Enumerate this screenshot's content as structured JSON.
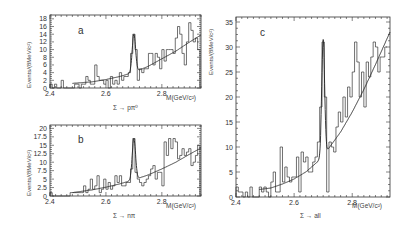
{
  "figure": {
    "xlabel": "M(GeV/c²)",
    "ylabel": "Events/(8MeV/c²)"
  },
  "chart_data": [
    {
      "type": "bar",
      "panel": "a",
      "subtitle": "Σ → pπ⁰",
      "xlabel": "M(GeV/c²)",
      "ylabel": "Events/(8MeV/c²)",
      "xlim": [
        2.4,
        2.94
      ],
      "ylim": [
        0,
        19
      ],
      "xticks": [
        2.4,
        2.6,
        2.8
      ],
      "yticks": [
        0,
        2,
        4,
        6,
        8,
        10,
        12,
        14,
        16,
        18
      ],
      "box": {
        "x0": 50,
        "x1": 201,
        "y0": 15,
        "y1": 88
      },
      "bin_width": 0.008,
      "x": [
        2.404,
        2.412,
        2.42,
        2.428,
        2.436,
        2.444,
        2.452,
        2.46,
        2.468,
        2.476,
        2.484,
        2.492,
        2.5,
        2.508,
        2.516,
        2.524,
        2.532,
        2.54,
        2.548,
        2.556,
        2.564,
        2.572,
        2.58,
        2.588,
        2.596,
        2.604,
        2.612,
        2.62,
        2.628,
        2.636,
        2.644,
        2.652,
        2.66,
        2.668,
        2.676,
        2.684,
        2.692,
        2.7,
        2.708,
        2.716,
        2.724,
        2.732,
        2.74,
        2.748,
        2.756,
        2.764,
        2.772,
        2.78,
        2.788,
        2.796,
        2.804,
        2.812,
        2.82,
        2.828,
        2.836,
        2.844,
        2.852,
        2.86,
        2.868,
        2.876,
        2.884,
        2.892,
        2.9,
        2.908,
        2.916,
        2.924,
        2.932
      ],
      "values": [
        1,
        0,
        1,
        0,
        0,
        2,
        0,
        0,
        0,
        0,
        0,
        1,
        1,
        0,
        1,
        1,
        3,
        2,
        1,
        1,
        6,
        3,
        2,
        2,
        1,
        2,
        0,
        3,
        1,
        2,
        1,
        4,
        2,
        3,
        3,
        4,
        9,
        14,
        10,
        2,
        5,
        4,
        5,
        5,
        9,
        9,
        6,
        9,
        8,
        5,
        10,
        7,
        10,
        10,
        10,
        9,
        13,
        16,
        14,
        9,
        6,
        12,
        17,
        15,
        12,
        13,
        10
      ],
      "fit": {
        "peak_center": 2.7,
        "peak_height": 14,
        "peak_sigma": 0.006
      },
      "bg_curve": [
        [
          2.48,
          1.2
        ],
        [
          2.55,
          1.6
        ],
        [
          2.6,
          2.2
        ],
        [
          2.65,
          3.0
        ],
        [
          2.7,
          4.1
        ],
        [
          2.75,
          5.6
        ],
        [
          2.8,
          7.6
        ],
        [
          2.85,
          9.6
        ],
        [
          2.9,
          12.0
        ],
        [
          2.94,
          13.8
        ]
      ]
    },
    {
      "type": "bar",
      "panel": "b",
      "subtitle": "Σ → nπ",
      "xlabel": "M(GeV/c²)",
      "ylabel": "Events/(8MeV/c²)",
      "xlim": [
        2.4,
        2.94
      ],
      "ylim": [
        0,
        21
      ],
      "xticks": [
        2.4,
        2.6,
        2.8
      ],
      "yticks": [
        0,
        2.5,
        5,
        7.5,
        10,
        12.5,
        15,
        17.5,
        20
      ],
      "box": {
        "x0": 50,
        "x1": 201,
        "y0": 125,
        "y1": 196
      },
      "bin_width": 0.008,
      "x": [
        2.404,
        2.412,
        2.42,
        2.428,
        2.436,
        2.444,
        2.452,
        2.46,
        2.468,
        2.476,
        2.484,
        2.492,
        2.5,
        2.508,
        2.516,
        2.524,
        2.532,
        2.54,
        2.548,
        2.556,
        2.564,
        2.572,
        2.58,
        2.588,
        2.596,
        2.604,
        2.612,
        2.62,
        2.628,
        2.636,
        2.644,
        2.652,
        2.66,
        2.668,
        2.676,
        2.684,
        2.692,
        2.7,
        2.708,
        2.716,
        2.724,
        2.732,
        2.74,
        2.748,
        2.756,
        2.764,
        2.772,
        2.78,
        2.788,
        2.796,
        2.804,
        2.812,
        2.82,
        2.828,
        2.836,
        2.844,
        2.852,
        2.86,
        2.868,
        2.876,
        2.884,
        2.892,
        2.9,
        2.908,
        2.916,
        2.924,
        2.932
      ],
      "values": [
        1,
        0,
        0,
        0,
        0,
        0,
        0,
        0,
        0,
        1,
        1,
        1,
        1,
        1,
        1,
        3,
        1,
        2,
        5,
        2,
        3,
        6,
        1,
        2,
        5,
        2,
        4,
        2,
        3,
        6,
        4,
        6,
        3,
        3,
        4,
        4,
        8,
        17,
        7,
        5,
        4,
        3,
        4,
        5,
        6,
        8,
        9,
        5,
        7,
        7,
        3,
        16,
        12,
        17,
        14,
        17,
        16,
        11,
        12,
        14,
        12,
        13,
        14,
        9,
        10,
        12,
        15
      ],
      "fit": {
        "peak_center": 2.7,
        "peak_height": 17,
        "peak_sigma": 0.006
      },
      "bg_curve": [
        [
          2.48,
          1.0
        ],
        [
          2.55,
          1.8
        ],
        [
          2.6,
          2.6
        ],
        [
          2.65,
          3.6
        ],
        [
          2.7,
          4.8
        ],
        [
          2.75,
          6.2
        ],
        [
          2.8,
          8.0
        ],
        [
          2.85,
          10.0
        ],
        [
          2.9,
          12.4
        ],
        [
          2.94,
          14.2
        ]
      ]
    },
    {
      "type": "bar",
      "panel": "c",
      "subtitle": "Σ → all",
      "xlabel": "M(GeV/c²)",
      "ylabel": "Events/(8MeV/c²)",
      "xlim": [
        2.4,
        2.93
      ],
      "ylim": [
        0,
        36
      ],
      "xticks": [
        2.4,
        2.6,
        2.8
      ],
      "yticks": [
        0,
        5,
        10,
        15,
        20,
        25,
        30,
        35
      ],
      "box": {
        "x0": 236,
        "x1": 390,
        "y0": 17,
        "y1": 197
      },
      "bin_width": 0.008,
      "x": [
        2.404,
        2.412,
        2.42,
        2.428,
        2.436,
        2.444,
        2.452,
        2.46,
        2.468,
        2.476,
        2.484,
        2.492,
        2.5,
        2.508,
        2.516,
        2.524,
        2.532,
        2.54,
        2.548,
        2.556,
        2.564,
        2.572,
        2.58,
        2.588,
        2.596,
        2.604,
        2.612,
        2.62,
        2.628,
        2.636,
        2.644,
        2.652,
        2.66,
        2.668,
        2.676,
        2.684,
        2.692,
        2.7,
        2.708,
        2.716,
        2.724,
        2.732,
        2.74,
        2.748,
        2.756,
        2.764,
        2.772,
        2.78,
        2.788,
        2.796,
        2.804,
        2.812,
        2.82,
        2.828,
        2.836,
        2.844,
        2.852,
        2.86,
        2.868,
        2.876,
        2.884,
        2.892,
        2.9,
        2.908,
        2.916,
        2.924
      ],
      "values": [
        2,
        1,
        1,
        0,
        1,
        0,
        2,
        0,
        0,
        0,
        2,
        1,
        2,
        1,
        0,
        3,
        5,
        1,
        1,
        10,
        3,
        6,
        4,
        3,
        4,
        4,
        8,
        1,
        9,
        7,
        8,
        5,
        5,
        7,
        8,
        11,
        18,
        31,
        20,
        1,
        11,
        10,
        9,
        14,
        17,
        15,
        20,
        16,
        22,
        20,
        25,
        31,
        27,
        20,
        25,
        18,
        27,
        24,
        28,
        31,
        30,
        25,
        28,
        28,
        30
      ],
      "fit": {
        "peak_center": 2.7,
        "peak_height": 31.5,
        "peak_sigma": 0.005
      },
      "bg_curve": [
        [
          2.48,
          1.5
        ],
        [
          2.52,
          1.8
        ],
        [
          2.56,
          2.6
        ],
        [
          2.6,
          3.6
        ],
        [
          2.64,
          5.0
        ],
        [
          2.68,
          7.0
        ],
        [
          2.7,
          8.2
        ],
        [
          2.72,
          9.8
        ],
        [
          2.76,
          13.0
        ],
        [
          2.8,
          17.0
        ],
        [
          2.84,
          21.5
        ],
        [
          2.88,
          26.5
        ],
        [
          2.93,
          33.0
        ]
      ]
    }
  ],
  "panels": {
    "a": {
      "letter": "a",
      "decay": "Σ → pπ⁰"
    },
    "b": {
      "letter": "b",
      "decay": "Σ → nπ"
    },
    "c": {
      "letter": "c",
      "decay": "Σ → all"
    }
  }
}
